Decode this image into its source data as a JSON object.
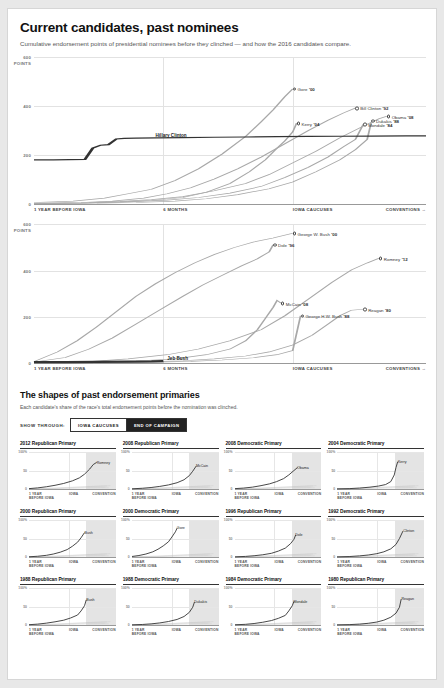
{
  "header": {
    "title": "Current candidates, past nominees",
    "subtitle": "Cumulative endorsement points of presidential nominees before they clinched — and how the 2016 candidates compare."
  },
  "axis": {
    "x_ticks": [
      "1 YEAR BEFORE IOWA",
      "6 MONTHS",
      "IOWA CAUCUSES",
      "CONVENTIONS →"
    ],
    "y_ticks_top": "600\nPOINTS",
    "y_ticks": [
      "600 POINTS",
      "400",
      "200",
      "0"
    ]
  },
  "chart_data": [
    {
      "type": "line",
      "id": "democrats",
      "title": "Current candidates, past nominees",
      "subtitle": "Cumulative endorsement points of presidential nominees before they clinched — and how the 2016 candidates compare.",
      "xlabel": "",
      "ylabel": "POINTS",
      "ylim": [
        0,
        600
      ],
      "xlim": [
        0,
        100
      ],
      "grid": true,
      "x_tick_labels": [
        "1 YEAR BEFORE IOWA",
        "6 MONTHS",
        "IOWA CAUCUSES",
        "CONVENTIONS →"
      ],
      "x_tick_positions": [
        0,
        33,
        66,
        100
      ],
      "y_tick_labels": [
        "600 POINTS",
        "400",
        "200",
        "0"
      ],
      "y_tick_values": [
        600,
        400,
        200,
        0
      ],
      "endpoint_labels": [
        {
          "name": "Gore",
          "year": "'00",
          "x": 66.0,
          "y": 470
        },
        {
          "name": "Bill Clinton",
          "year": "'92",
          "x": 82.0,
          "y": 392
        },
        {
          "name": "Obama",
          "year": "'08",
          "x": 90.0,
          "y": 358
        },
        {
          "name": "Kerry",
          "year": "'04",
          "x": 67.0,
          "y": 330
        },
        {
          "name": "Mondale",
          "year": "'84",
          "x": 84.0,
          "y": 325
        },
        {
          "name": "Dukakis",
          "year": "'88",
          "x": 86.0,
          "y": 332
        }
      ],
      "inline_labels": [
        {
          "name": "Hillary Clinton",
          "x": 30,
          "y": 268
        }
      ],
      "series": [
        {
          "name": "Gore '00",
          "color": "#9a9a9a"
        },
        {
          "name": "Bill Clinton '92",
          "color": "#9a9a9a"
        },
        {
          "name": "Obama '08",
          "color": "#9a9a9a"
        },
        {
          "name": "Kerry '04",
          "color": "#9a9a9a"
        },
        {
          "name": "Mondale '84",
          "color": "#9a9a9a"
        },
        {
          "name": "Dukakis '88",
          "color": "#9a9a9a"
        },
        {
          "name": "Hillary Clinton",
          "color": "#333333"
        }
      ]
    },
    {
      "type": "line",
      "id": "republicans",
      "title": "",
      "ylim": [
        0,
        600
      ],
      "xlim": [
        0,
        100
      ],
      "grid": true,
      "x_tick_labels": [
        "1 YEAR BEFORE IOWA",
        "6 MONTHS",
        "IOWA CAUCUSES",
        "CONVENTIONS →"
      ],
      "x_tick_positions": [
        0,
        33,
        66,
        100
      ],
      "y_tick_labels": [
        "600 POINTS",
        "400",
        "200",
        "0"
      ],
      "y_tick_values": [
        600,
        400,
        200,
        0
      ],
      "endpoint_labels": [
        {
          "name": "George W. Bush",
          "year": "'00",
          "x": 66.0,
          "y": 560
        },
        {
          "name": "Dole",
          "year": "'96",
          "x": 61.0,
          "y": 510
        },
        {
          "name": "Romney",
          "year": "'12",
          "x": 88.0,
          "y": 452
        },
        {
          "name": "McCain",
          "year": "'08",
          "x": 63.0,
          "y": 258
        },
        {
          "name": "Reagan",
          "year": "'80",
          "x": 84.0,
          "y": 232
        },
        {
          "name": "George H.W. Bush",
          "year": "'88",
          "x": 68.0,
          "y": 204
        }
      ],
      "inline_labels": [
        {
          "name": "Jeb Bush",
          "x": 32,
          "y": 34
        }
      ],
      "series": [
        {
          "name": "George W. Bush '00",
          "color": "#9a9a9a"
        },
        {
          "name": "Dole '96",
          "color": "#9a9a9a"
        },
        {
          "name": "Romney '12",
          "color": "#9a9a9a"
        },
        {
          "name": "McCain '08",
          "color": "#9a9a9a"
        },
        {
          "name": "Reagan '80",
          "color": "#9a9a9a"
        },
        {
          "name": "George H.W. Bush '88",
          "color": "#9a9a9a"
        },
        {
          "name": "Jeb Bush",
          "color": "#333333"
        }
      ]
    }
  ],
  "section2": {
    "title": "The shapes of past endorsement primaries",
    "subtitle": "Each candidate's share of the race's total endorsement points before the nomination was clinched.",
    "control_label": "SHOW THROUGH:",
    "toggle_options": [
      {
        "label": "IOWA CAUCUSES",
        "active": false
      },
      {
        "label": "END OF CAMPAIGN",
        "active": true
      }
    ],
    "small_axis": {
      "y_ticks": [
        "100%",
        "50",
        "0"
      ],
      "x_ticks": [
        "1 YEAR BEFORE IOWA",
        "IOWA",
        "CONVENTION"
      ]
    },
    "small_charts": [
      {
        "title": "2012 Republican Primary",
        "winner": "Romney",
        "winner_x": 78,
        "winner_y": 72
      },
      {
        "title": "2008 Republican Primary",
        "winner": "McCain",
        "winner_x": 74,
        "winner_y": 62
      },
      {
        "title": "2008 Democratic Primary",
        "winner": "Obama",
        "winner_x": 72,
        "winner_y": 58
      },
      {
        "title": "2004 Democratic Primary",
        "winner": "Kerry",
        "winner_x": 70,
        "winner_y": 74
      },
      {
        "title": "2000 Republican Primary",
        "winner": "Bush",
        "winner_x": 64,
        "winner_y": 66
      },
      {
        "title": "2000 Democratic Primary",
        "winner": "Gore",
        "winner_x": 52,
        "winner_y": 78
      },
      {
        "title": "1996 Republican Primary",
        "winner": "Dole",
        "winner_x": 70,
        "winner_y": 60
      },
      {
        "title": "1992 Democratic Primary",
        "winner": "Clinton",
        "winner_x": 76,
        "winner_y": 70
      },
      {
        "title": "1988 Republican Primary",
        "winner": "Bush",
        "winner_x": 66,
        "winner_y": 68
      },
      {
        "title": "1988 Democratic Primary",
        "winner": "Dukakis",
        "winner_x": 72,
        "winner_y": 62
      },
      {
        "title": "1984 Democratic Primary",
        "winner": "Mondale",
        "winner_x": 68,
        "winner_y": 64
      },
      {
        "title": "1980 Republican Primary",
        "winner": "Reagan",
        "winner_x": 74,
        "winner_y": 70
      }
    ]
  }
}
